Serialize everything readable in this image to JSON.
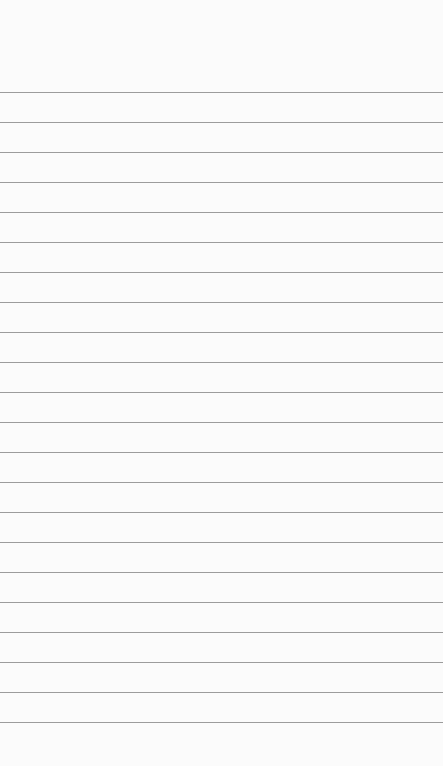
{
  "page": {
    "background": "#fbfbfb",
    "rule_color": "#9c9c9c",
    "rule_first_y": 92,
    "rule_spacing": 30,
    "rule_count": 22
  }
}
